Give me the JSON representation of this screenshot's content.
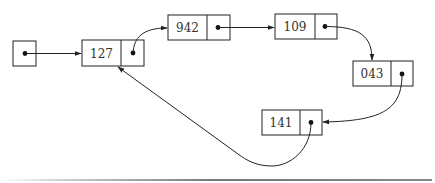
{
  "diagram": {
    "type": "linked-list",
    "colors": {
      "stroke": "#222222",
      "text": "#333333",
      "background": "#ffffff",
      "rule": "#777777"
    },
    "head": {
      "label": "head pointer",
      "points_to": "127"
    },
    "nodes": [
      {
        "id": "n127",
        "value": "127",
        "next": "942"
      },
      {
        "id": "n942",
        "value": "942",
        "next": "109"
      },
      {
        "id": "n109",
        "value": "109",
        "next": "043"
      },
      {
        "id": "n043",
        "value": "043",
        "next": "141"
      },
      {
        "id": "n141",
        "value": "141",
        "next": "127"
      }
    ]
  }
}
